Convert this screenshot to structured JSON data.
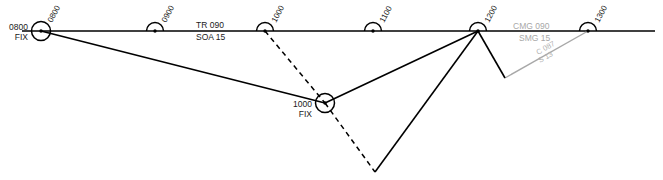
{
  "diagram": {
    "type": "air-navigation-plot",
    "background_color": "#ffffff",
    "track_color": "#000000",
    "drift_color": "#a8a8a8",
    "canvas": {
      "width": 663,
      "height": 180
    },
    "track_line": {
      "name": "intended-track-line",
      "x1": 22,
      "y1": 31,
      "x2": 655,
      "y2": 31
    },
    "track_labels": {
      "track": "TR 090",
      "speed": "SOA 15",
      "made_good_track": "CMG 090",
      "made_good_speed": "SMG 15",
      "correction_course": "C 087",
      "correction_speed": "S 13"
    },
    "time_marks": [
      {
        "label": "0800",
        "x": 41,
        "y": 31,
        "kind": "fix",
        "fix_label": "0800",
        "fix_text": "FIX"
      },
      {
        "label": "0900",
        "x": 155,
        "y": 31,
        "kind": "halfmark",
        "fix_label": "",
        "fix_text": ""
      },
      {
        "label": "1000",
        "x": 265,
        "y": 31,
        "kind": "halfmark",
        "fix_label": "",
        "fix_text": ""
      },
      {
        "label": "1100",
        "x": 373,
        "y": 31,
        "kind": "halfmark",
        "fix_label": "",
        "fix_text": ""
      },
      {
        "label": "1200",
        "x": 478,
        "y": 31,
        "kind": "halfmark",
        "fix_label": "",
        "fix_text": ""
      },
      {
        "label": "1300",
        "x": 588,
        "y": 31,
        "kind": "halfmark",
        "fix_label": "",
        "fix_text": ""
      }
    ],
    "fix_nodes": [
      {
        "name": "fix-0800",
        "time": "0800",
        "text": "FIX",
        "x": 41,
        "y": 31
      },
      {
        "name": "fix-1000",
        "time": "1000",
        "text": "FIX",
        "x": 325,
        "y": 103
      }
    ],
    "solid_segments": [
      {
        "name": "leg-0800-to-1000fix",
        "x1": 41,
        "y1": 31,
        "x2": 325,
        "y2": 103
      },
      {
        "name": "leg-1000fix-to-1200",
        "x1": 325,
        "y1": 103,
        "x2": 478,
        "y2": 31
      },
      {
        "name": "leg-1200-to-vertex",
        "x1": 478,
        "y1": 31,
        "x2": 375,
        "y2": 172
      },
      {
        "name": "leg-1200-to-drift",
        "x1": 478,
        "y1": 31,
        "x2": 505,
        "y2": 78
      }
    ],
    "dashed_segments": [
      {
        "name": "planned-track-1000-to-fix",
        "x1": 265,
        "y1": 31,
        "x2": 325,
        "y2": 103
      },
      {
        "name": "planned-track-fix-to-vertex",
        "x1": 325,
        "y1": 103,
        "x2": 375,
        "y2": 172
      }
    ],
    "gray_segments": [
      {
        "name": "correction-leg-to-1300",
        "x1": 505,
        "y1": 78,
        "x2": 588,
        "y2": 31
      }
    ]
  }
}
